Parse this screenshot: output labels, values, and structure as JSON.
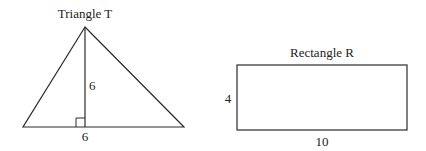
{
  "triangle": {
    "title": "Triangle T",
    "height_label": "6",
    "base_label": "6",
    "stroke_color": "#2a2a2a"
  },
  "rectangle": {
    "title": "Rectangle R",
    "height_label": "4",
    "width_label": "10",
    "stroke_color": "#2a2a2a"
  }
}
